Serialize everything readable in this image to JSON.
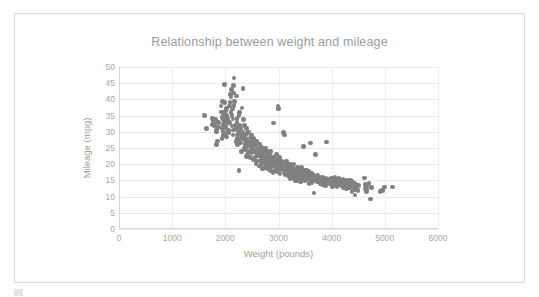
{
  "chart_data": {
    "type": "scatter",
    "title": "Relationship between weight and mileage",
    "xlabel": "Weight (pounds)",
    "ylabel": "Mileage (mpg)",
    "xlim": [
      0,
      6000
    ],
    "ylim": [
      0,
      50
    ],
    "xticks": [
      0,
      1000,
      2000,
      3000,
      4000,
      5000,
      6000
    ],
    "yticks": [
      0,
      5,
      10,
      15,
      20,
      25,
      30,
      35,
      40,
      45,
      50
    ],
    "grid": "horizontal-and-vertical",
    "legend": "none",
    "marker_color": "#808080",
    "marker_size_px": 4.6,
    "points": [
      [
        1613,
        35.0
      ],
      [
        1649,
        31.0
      ],
      [
        1755,
        32.2
      ],
      [
        1760,
        34.1
      ],
      [
        1773,
        33.5
      ],
      [
        1795,
        33.0
      ],
      [
        1800,
        31.9
      ],
      [
        1825,
        33.8
      ],
      [
        1834,
        30.5
      ],
      [
        1835,
        26.0
      ],
      [
        1836,
        30.0
      ],
      [
        1845,
        30.9
      ],
      [
        1850,
        27.2
      ],
      [
        1867,
        31.5
      ],
      [
        1875,
        32.8
      ],
      [
        1915,
        38.0
      ],
      [
        1925,
        36.1
      ],
      [
        1937,
        34.5
      ],
      [
        1940,
        28.0
      ],
      [
        1945,
        39.4
      ],
      [
        1950,
        31.0
      ],
      [
        1955,
        32.3
      ],
      [
        1963,
        29.0
      ],
      [
        1965,
        33.7
      ],
      [
        1968,
        35.7
      ],
      [
        1970,
        30.0
      ],
      [
        1975,
        31.6
      ],
      [
        1980,
        39.1
      ],
      [
        1985,
        44.6
      ],
      [
        1990,
        34.2
      ],
      [
        1995,
        33.0
      ],
      [
        2000,
        29.5
      ],
      [
        2003,
        36.4
      ],
      [
        2015,
        31.3
      ],
      [
        2019,
        28.4
      ],
      [
        2020,
        35.1
      ],
      [
        2025,
        37.2
      ],
      [
        2035,
        32.4
      ],
      [
        2045,
        34.3
      ],
      [
        2050,
        33.5
      ],
      [
        2065,
        30.4
      ],
      [
        2070,
        29.8
      ],
      [
        2074,
        32.9
      ],
      [
        2075,
        38.0
      ],
      [
        2085,
        39.0
      ],
      [
        2100,
        41.5
      ],
      [
        2108,
        36.0
      ],
      [
        2110,
        40.8
      ],
      [
        2120,
        43.1
      ],
      [
        2124,
        35.0
      ],
      [
        2125,
        31.8
      ],
      [
        2130,
        37.0
      ],
      [
        2144,
        34.0
      ],
      [
        2145,
        29.0
      ],
      [
        2150,
        30.5
      ],
      [
        2155,
        42.0
      ],
      [
        2158,
        44.3
      ],
      [
        2160,
        38.1
      ],
      [
        2164,
        46.6
      ],
      [
        2171,
        39.4
      ],
      [
        2190,
        32.0
      ],
      [
        2200,
        27.0
      ],
      [
        2205,
        41.0
      ],
      [
        2210,
        31.0
      ],
      [
        2219,
        33.0
      ],
      [
        2220,
        29.0
      ],
      [
        2223,
        34.1
      ],
      [
        2230,
        28.0
      ],
      [
        2234,
        26.0
      ],
      [
        2245,
        30.0
      ],
      [
        2254,
        35.0
      ],
      [
        2255,
        18.0
      ],
      [
        2260,
        27.5
      ],
      [
        2265,
        32.0
      ],
      [
        2270,
        36.0
      ],
      [
        2275,
        29.5
      ],
      [
        2280,
        31.0
      ],
      [
        2288,
        26.5
      ],
      [
        2295,
        28.8
      ],
      [
        2300,
        24.0
      ],
      [
        2310,
        37.3
      ],
      [
        2320,
        27.9
      ],
      [
        2330,
        30.0
      ],
      [
        2335,
        43.4
      ],
      [
        2340,
        33.8
      ],
      [
        2350,
        25.0
      ],
      [
        2355,
        29.0
      ],
      [
        2360,
        32.0
      ],
      [
        2370,
        27.2
      ],
      [
        2375,
        26.0
      ],
      [
        2379,
        24.5
      ],
      [
        2385,
        28.0
      ],
      [
        2395,
        31.0
      ],
      [
        2400,
        22.3
      ],
      [
        2405,
        25.8
      ],
      [
        2408,
        29.5
      ],
      [
        2420,
        23.0
      ],
      [
        2430,
        27.0
      ],
      [
        2435,
        26.8
      ],
      [
        2440,
        30.0
      ],
      [
        2450,
        24.0
      ],
      [
        2464,
        28.1
      ],
      [
        2470,
        25.5
      ],
      [
        2475,
        22.0
      ],
      [
        2480,
        26.4
      ],
      [
        2490,
        29.0
      ],
      [
        2500,
        23.6
      ],
      [
        2506,
        24.3
      ],
      [
        2510,
        27.0
      ],
      [
        2520,
        25.0
      ],
      [
        2525,
        21.5
      ],
      [
        2535,
        28.0
      ],
      [
        2545,
        23.9
      ],
      [
        2550,
        26.0
      ],
      [
        2556,
        22.0
      ],
      [
        2565,
        24.0
      ],
      [
        2575,
        25.4
      ],
      [
        2580,
        20.2
      ],
      [
        2590,
        27.2
      ],
      [
        2595,
        23.0
      ],
      [
        2600,
        21.0
      ],
      [
        2605,
        26.6
      ],
      [
        2615,
        24.0
      ],
      [
        2620,
        22.5
      ],
      [
        2634,
        25.0
      ],
      [
        2640,
        19.5
      ],
      [
        2648,
        23.2
      ],
      [
        2650,
        26.0
      ],
      [
        2660,
        21.0
      ],
      [
        2665,
        24.4
      ],
      [
        2670,
        20.0
      ],
      [
        2672,
        22.0
      ],
      [
        2678,
        25.1
      ],
      [
        2690,
        23.0
      ],
      [
        2700,
        18.6
      ],
      [
        2710,
        21.5
      ],
      [
        2715,
        24.0
      ],
      [
        2720,
        20.5
      ],
      [
        2725,
        22.3
      ],
      [
        2735,
        23.8
      ],
      [
        2740,
        19.0
      ],
      [
        2745,
        21.0
      ],
      [
        2750,
        25.0
      ],
      [
        2755,
        22.0
      ],
      [
        2760,
        20.0
      ],
      [
        2770,
        23.4
      ],
      [
        2780,
        18.5
      ],
      [
        2789,
        21.6
      ],
      [
        2795,
        24.0
      ],
      [
        2800,
        19.4
      ],
      [
        2807,
        22.0
      ],
      [
        2815,
        20.3
      ],
      [
        2820,
        23.0
      ],
      [
        2830,
        21.0
      ],
      [
        2835,
        19.0
      ],
      [
        2845,
        22.4
      ],
      [
        2850,
        18.0
      ],
      [
        2855,
        20.6
      ],
      [
        2860,
        24.0
      ],
      [
        2865,
        21.5
      ],
      [
        2868,
        19.2
      ],
      [
        2875,
        22.0
      ],
      [
        2890,
        20.0
      ],
      [
        2900,
        17.5
      ],
      [
        2904,
        21.0
      ],
      [
        2910,
        32.7
      ],
      [
        2920,
        19.8
      ],
      [
        2930,
        22.0
      ],
      [
        2945,
        18.2
      ],
      [
        2950,
        20.5
      ],
      [
        2957,
        23.0
      ],
      [
        2965,
        19.0
      ],
      [
        2970,
        21.4
      ],
      [
        2979,
        17.6
      ],
      [
        2984,
        20.0
      ],
      [
        2990,
        38.0
      ],
      [
        2995,
        37.2
      ],
      [
        3000,
        18.8
      ],
      [
        3005,
        21.0
      ],
      [
        3012,
        19.5
      ],
      [
        3021,
        22.0
      ],
      [
        3030,
        17.0
      ],
      [
        3035,
        20.2
      ],
      [
        3039,
        18.4
      ],
      [
        3060,
        21.0
      ],
      [
        3070,
        19.0
      ],
      [
        3085,
        20.0
      ],
      [
        3090,
        29.8
      ],
      [
        3100,
        17.5
      ],
      [
        3102,
        18.6
      ],
      [
        3110,
        29.0
      ],
      [
        3115,
        20.4
      ],
      [
        3120,
        16.8
      ],
      [
        3139,
        19.2
      ],
      [
        3145,
        18.0
      ],
      [
        3150,
        21.0
      ],
      [
        3155,
        17.2
      ],
      [
        3160,
        19.5
      ],
      [
        3169,
        18.0
      ],
      [
        3190,
        16.5
      ],
      [
        3193,
        20.0
      ],
      [
        3200,
        17.8
      ],
      [
        3205,
        19.0
      ],
      [
        3210,
        16.0
      ],
      [
        3211,
        18.5
      ],
      [
        3221,
        20.1
      ],
      [
        3230,
        15.5
      ],
      [
        3233,
        17.0
      ],
      [
        3245,
        18.8
      ],
      [
        3250,
        16.2
      ],
      [
        3265,
        19.0
      ],
      [
        3270,
        17.4
      ],
      [
        3278,
        18.0
      ],
      [
        3282,
        15.8
      ],
      [
        3288,
        20.0
      ],
      [
        3300,
        16.5
      ],
      [
        3302,
        18.2
      ],
      [
        3310,
        14.8
      ],
      [
        3320,
        17.0
      ],
      [
        3330,
        18.5
      ],
      [
        3336,
        15.0
      ],
      [
        3350,
        17.6
      ],
      [
        3353,
        19.0
      ],
      [
        3360,
        16.0
      ],
      [
        3365,
        18.0
      ],
      [
        3380,
        15.4
      ],
      [
        3381,
        17.2
      ],
      [
        3399,
        18.6
      ],
      [
        3400,
        16.0
      ],
      [
        3410,
        14.5
      ],
      [
        3415,
        17.0
      ],
      [
        3420,
        18.0
      ],
      [
        3425,
        15.8
      ],
      [
        3430,
        16.5
      ],
      [
        3433,
        19.0
      ],
      [
        3439,
        17.4
      ],
      [
        3445,
        15.0
      ],
      [
        3449,
        18.0
      ],
      [
        3459,
        16.2
      ],
      [
        3465,
        17.0
      ],
      [
        3470,
        25.4
      ],
      [
        3475,
        15.5
      ],
      [
        3480,
        18.0
      ],
      [
        3490,
        16.8
      ],
      [
        3500,
        14.9
      ],
      [
        3504,
        17.5
      ],
      [
        3520,
        16.0
      ],
      [
        3525,
        18.2
      ],
      [
        3530,
        15.2
      ],
      [
        3535,
        17.0
      ],
      [
        3563,
        16.4
      ],
      [
        3570,
        14.0
      ],
      [
        3574,
        17.8
      ],
      [
        3590,
        15.6
      ],
      [
        3605,
        16.9
      ],
      [
        3605,
        26.6
      ],
      [
        3613,
        15.0
      ],
      [
        3620,
        17.2
      ],
      [
        3630,
        14.2
      ],
      [
        3632,
        16.0
      ],
      [
        3645,
        15.5
      ],
      [
        3651,
        17.0
      ],
      [
        3664,
        11.1
      ],
      [
        3672,
        16.2
      ],
      [
        3693,
        14.8
      ],
      [
        3700,
        23.0
      ],
      [
        3725,
        15.8
      ],
      [
        3730,
        14.5
      ],
      [
        3735,
        16.5
      ],
      [
        3755,
        15.0
      ],
      [
        3777,
        16.0
      ],
      [
        3781,
        14.0
      ],
      [
        3820,
        15.5
      ],
      [
        3830,
        13.8
      ],
      [
        3840,
        16.0
      ],
      [
        3850,
        14.6
      ],
      [
        3870,
        15.2
      ],
      [
        3880,
        13.5
      ],
      [
        3892,
        15.8
      ],
      [
        3900,
        26.8
      ],
      [
        3907,
        14.2
      ],
      [
        3940,
        15.0
      ],
      [
        3955,
        13.9
      ],
      [
        3962,
        15.4
      ],
      [
        3988,
        14.5
      ],
      [
        4000,
        15.8
      ],
      [
        4020,
        13.2
      ],
      [
        4029,
        14.8
      ],
      [
        4042,
        15.5
      ],
      [
        4054,
        14.0
      ],
      [
        4060,
        16.0
      ],
      [
        4077,
        13.6
      ],
      [
        4080,
        15.0
      ],
      [
        4082,
        14.4
      ],
      [
        4096,
        15.2
      ],
      [
        4100,
        13.0
      ],
      [
        4129,
        14.7
      ],
      [
        4135,
        15.5
      ],
      [
        4140,
        13.8
      ],
      [
        4154,
        14.2
      ],
      [
        4165,
        15.0
      ],
      [
        4190,
        13.4
      ],
      [
        4209,
        14.5
      ],
      [
        4215,
        15.2
      ],
      [
        4220,
        12.8
      ],
      [
        4237,
        14.0
      ],
      [
        4254,
        15.0
      ],
      [
        4257,
        13.5
      ],
      [
        4274,
        14.8
      ],
      [
        4278,
        12.5
      ],
      [
        4295,
        13.9
      ],
      [
        4312,
        15.0
      ],
      [
        4325,
        13.2
      ],
      [
        4335,
        14.5
      ],
      [
        4341,
        12.9
      ],
      [
        4354,
        13.8
      ],
      [
        4360,
        15.0
      ],
      [
        4363,
        14.0
      ],
      [
        4380,
        13.0
      ],
      [
        4382,
        14.6
      ],
      [
        4385,
        11.5
      ],
      [
        4390,
        13.5
      ],
      [
        4422,
        12.2
      ],
      [
        4425,
        14.0
      ],
      [
        4440,
        13.0
      ],
      [
        4441,
        10.5
      ],
      [
        4449,
        13.8
      ],
      [
        4456,
        12.0
      ],
      [
        4464,
        13.2
      ],
      [
        4499,
        11.8
      ],
      [
        4502,
        13.5
      ],
      [
        4615,
        15.8
      ],
      [
        4633,
        12.5
      ],
      [
        4638,
        13.8
      ],
      [
        4654,
        11.5
      ],
      [
        4657,
        13.0
      ],
      [
        4668,
        12.0
      ],
      [
        4699,
        14.0
      ],
      [
        4732,
        9.2
      ],
      [
        4746,
        12.8
      ],
      [
        4906,
        11.5
      ],
      [
        4951,
        11.8
      ],
      [
        4952,
        12.0
      ],
      [
        4997,
        13.0
      ],
      [
        5140,
        13.0
      ]
    ]
  },
  "caption": {
    "text": ""
  }
}
